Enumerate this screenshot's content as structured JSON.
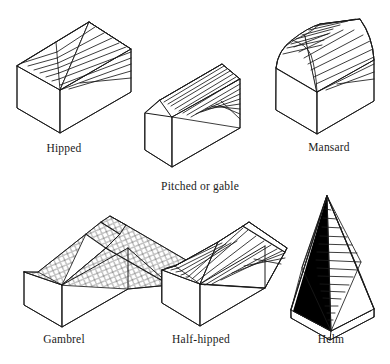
{
  "figure": {
    "background_color": "#ffffff",
    "line_color": "#1a1a1a",
    "fill_color": "#ffffff",
    "shade_color": "#000000",
    "items": [
      {
        "id": "hipped",
        "label": "Hipped",
        "roof_surface": "ruled-lines",
        "description": "Hipped roof: sloping planes on all four sides meeting a short ridge"
      },
      {
        "id": "pitched",
        "label": "Pitched or gable",
        "roof_surface": "ruled-lines",
        "description": "Pitched or gable roof: two sloping planes meeting at a ridge with vertical gable ends"
      },
      {
        "id": "mansard",
        "label": "Mansard",
        "roof_surface": "ruled-lines",
        "description": "Mansard roof: double pitch, steep lower slope and shallow curved upper slope"
      },
      {
        "id": "gambrel",
        "label": "Gambrel",
        "roof_surface": "diamond-shingle-hatch",
        "description": "Gambrel roof: double-pitched gable with a small hip at the ridge end"
      },
      {
        "id": "half-hipped",
        "label": "Half-hipped",
        "roof_surface": "ruled-lines",
        "description": "Half-hipped roof: gable roof whose end is cut back to a small hip"
      },
      {
        "id": "helm",
        "label": "Helm",
        "roof_surface": "ruled-lines",
        "description": "Helm roof: tall pyramidal spire of four steep rhomboid faces on gables"
      }
    ]
  }
}
